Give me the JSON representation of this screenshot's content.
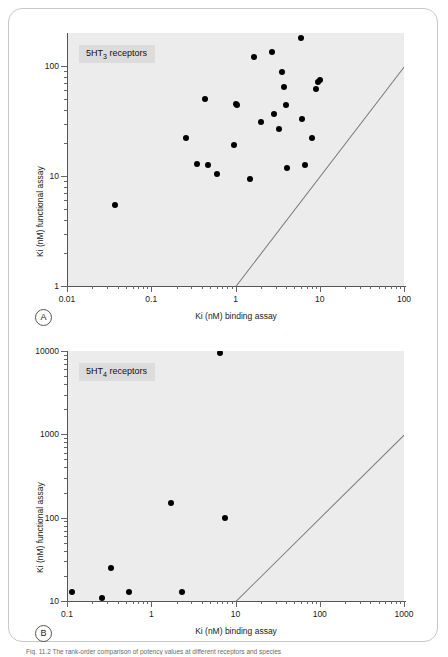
{
  "figure": {
    "caption": "Fig. 11.2 The rank-order comparison of potency values at different receptors and species"
  },
  "panels": [
    {
      "key": "A",
      "label": "A",
      "legend_prefix": "5HT",
      "legend_sub": "3",
      "legend_suffix": " receptors"
    },
    {
      "key": "B",
      "label": "B",
      "legend_prefix": "5HT",
      "legend_sub": "4",
      "legend_suffix": " receptors"
    }
  ],
  "chart_data": [
    {
      "type": "scatter",
      "panel": "A",
      "title": "5HT3 receptors",
      "xlabel": "Ki (nM) binding assay",
      "ylabel": "Ki (nM) functional assay",
      "xscale": "log",
      "yscale": "log",
      "xlim": [
        0.01,
        100
      ],
      "ylim": [
        1,
        200
      ],
      "xticks": [
        0.01,
        0.1,
        1,
        10,
        100
      ],
      "xticklabels": [
        "0.01",
        "0.1",
        "1",
        "10",
        "100"
      ],
      "yticks": [
        1,
        10,
        100
      ],
      "yticklabels": [
        "1",
        "10",
        "100"
      ],
      "grid": false,
      "legend": "none",
      "annotations": [
        {
          "text": "unity line (y = x)",
          "type": "line",
          "from": [
            1,
            1
          ],
          "to": [
            100,
            100
          ]
        }
      ],
      "points": [
        {
          "x": 0.037,
          "y": 5.5
        },
        {
          "x": 0.26,
          "y": 22
        },
        {
          "x": 0.35,
          "y": 13
        },
        {
          "x": 0.43,
          "y": 50
        },
        {
          "x": 0.47,
          "y": 12.5
        },
        {
          "x": 0.6,
          "y": 10.5
        },
        {
          "x": 0.95,
          "y": 19
        },
        {
          "x": 1.0,
          "y": 45
        },
        {
          "x": 1.05,
          "y": 44
        },
        {
          "x": 1.5,
          "y": 9.4
        },
        {
          "x": 1.65,
          "y": 120
        },
        {
          "x": 2.0,
          "y": 31
        },
        {
          "x": 2.7,
          "y": 135
        },
        {
          "x": 2.9,
          "y": 37
        },
        {
          "x": 3.3,
          "y": 27
        },
        {
          "x": 3.6,
          "y": 88
        },
        {
          "x": 3.8,
          "y": 65
        },
        {
          "x": 4.0,
          "y": 44
        },
        {
          "x": 4.1,
          "y": 11.8
        },
        {
          "x": 6.0,
          "y": 180
        },
        {
          "x": 6.2,
          "y": 33
        },
        {
          "x": 6.6,
          "y": 12.5
        },
        {
          "x": 8.0,
          "y": 22
        },
        {
          "x": 9.0,
          "y": 62
        },
        {
          "x": 9.6,
          "y": 72
        },
        {
          "x": 10.0,
          "y": 75
        }
      ]
    },
    {
      "type": "scatter",
      "panel": "B",
      "title": "5HT4 receptors",
      "xlabel": "Ki (nM) binding assay",
      "ylabel": "Ki (nM) functional assay",
      "xscale": "log",
      "yscale": "log",
      "xlim": [
        0.1,
        1000
      ],
      "ylim": [
        10,
        10000
      ],
      "xticks": [
        0.1,
        1,
        10,
        100,
        1000
      ],
      "xticklabels": [
        "0.1",
        "1",
        "10",
        "100",
        "1000"
      ],
      "yticks": [
        10,
        100,
        1000,
        10000
      ],
      "yticklabels": [
        "10",
        "100",
        "1000",
        "10000"
      ],
      "grid": false,
      "legend": "none",
      "annotations": [
        {
          "text": "unity line (y = x)",
          "type": "line",
          "from": [
            10,
            10
          ],
          "to": [
            1000,
            1000
          ]
        }
      ],
      "points": [
        {
          "x": 0.115,
          "y": 13
        },
        {
          "x": 0.26,
          "y": 10.8
        },
        {
          "x": 0.33,
          "y": 25
        },
        {
          "x": 0.55,
          "y": 13
        },
        {
          "x": 1.7,
          "y": 150
        },
        {
          "x": 2.3,
          "y": 13
        },
        {
          "x": 6.5,
          "y": 9500
        },
        {
          "x": 7.5,
          "y": 100
        }
      ]
    }
  ]
}
